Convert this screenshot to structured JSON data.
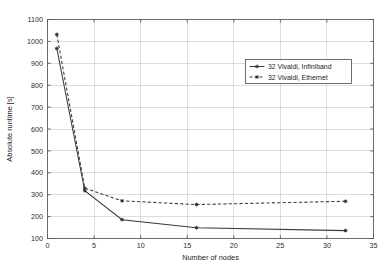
{
  "chart_data": {
    "type": "line",
    "title": "",
    "xlabel": "Number of nodes",
    "ylabel": "Absolute runtime [s]",
    "xlim": [
      0,
      35
    ],
    "ylim": [
      100,
      1100
    ],
    "xticks": [
      0,
      5,
      10,
      15,
      20,
      25,
      30,
      35
    ],
    "yticks": [
      100,
      200,
      300,
      400,
      500,
      600,
      700,
      800,
      900,
      1000,
      1100
    ],
    "xtick_labels": [
      "0",
      "5",
      "10",
      "15",
      "20",
      "25",
      "30",
      "35"
    ],
    "ytick_labels": [
      "100",
      "200",
      "300",
      "400",
      "500",
      "600",
      "700",
      "800",
      "900",
      "1000",
      "1100"
    ],
    "grid": true,
    "legend_position": "upper right",
    "x": [
      1,
      4,
      8,
      16,
      32
    ],
    "series": [
      {
        "name": "32 Vivaldi, Infiniband",
        "style": "solid",
        "marker": "star",
        "values": [
          968,
          318,
          186,
          149,
          136
        ]
      },
      {
        "name": "32 Vivaldi, Ethernet",
        "style": "dashed",
        "marker": "star",
        "values": [
          1032,
          330,
          272,
          255,
          270
        ]
      }
    ]
  },
  "legend": {
    "entries": [
      {
        "label": "32 Vivaldi, Infiniband"
      },
      {
        "label": "32 Vivaldi, Ethernet"
      }
    ]
  },
  "colors": {
    "line": "#3a3a3a",
    "grid": "#cfcfcf",
    "axis": "#6b6b6b",
    "text": "#1c1c1c",
    "background": "#ffffff"
  }
}
